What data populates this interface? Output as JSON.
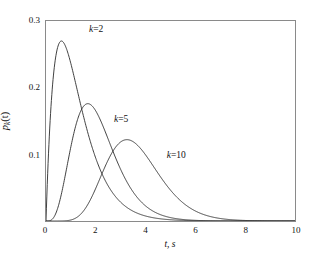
{
  "chart_data": {
    "type": "line",
    "title": "",
    "xlabel": "t, s",
    "ylabel": "p_k(t)",
    "ylabel_base": "p",
    "ylabel_sub": "k",
    "ylabel_arg": "(t)",
    "xlim": [
      0,
      10
    ],
    "ylim": [
      0,
      0.3
    ],
    "grid": false,
    "legend_position": "inline-annotations",
    "xticks": [
      {
        "value": 0,
        "label": "0"
      },
      {
        "value": 2,
        "label": "2"
      },
      {
        "value": 4,
        "label": "4"
      },
      {
        "value": 6,
        "label": "6"
      },
      {
        "value": 8,
        "label": "8"
      },
      {
        "value": 10,
        "label": "10"
      }
    ],
    "yticks": [
      {
        "value": 0.1,
        "label": "0.1"
      },
      {
        "value": 0.2,
        "label": "0.2"
      },
      {
        "value": 0.3,
        "label": "0.3"
      }
    ],
    "series": [
      {
        "name": "k=2",
        "label": "k=2",
        "k": 2,
        "color": "#2b2b2b",
        "peak_x": 0.62,
        "peak_y": 0.27,
        "annotation_x": 1.75,
        "annotation_y": 0.285,
        "x": [
          0.0,
          0.1,
          0.2,
          0.3,
          0.4,
          0.5,
          0.6,
          0.7,
          0.8,
          0.9,
          1.0,
          1.2,
          1.4,
          1.6,
          1.8,
          2.0,
          2.4,
          2.8,
          3.2,
          3.6,
          4.0,
          4.5,
          5.0,
          6.0,
          7.0,
          8.0,
          9.0,
          10.0
        ],
        "y": [
          0.0,
          0.1218,
          0.1968,
          0.2384,
          0.2569,
          0.2599,
          0.2529,
          0.2397,
          0.223,
          0.2045,
          0.1854,
          0.1483,
          0.1161,
          0.0895,
          0.0683,
          0.0515,
          0.0286,
          0.0155,
          0.0082,
          0.0043,
          0.0022,
          0.0009,
          0.0004,
          0.0001,
          0.0,
          0.0,
          0.0,
          0.0
        ]
      },
      {
        "name": "k=5",
        "label": "k=5",
        "k": 5,
        "color": "#2b2b2b",
        "peak_x": 1.68,
        "peak_y": 0.176,
        "annotation_x": 2.75,
        "annotation_y": 0.152,
        "x": [
          0.0,
          0.2,
          0.4,
          0.6,
          0.8,
          1.0,
          1.2,
          1.4,
          1.6,
          1.8,
          2.0,
          2.2,
          2.4,
          2.6,
          2.8,
          3.0,
          3.4,
          3.8,
          4.2,
          4.6,
          5.0,
          5.5,
          6.0,
          7.0,
          8.0,
          9.0,
          10.0
        ],
        "y": [
          0.0,
          0.0009,
          0.0123,
          0.0399,
          0.076,
          0.1109,
          0.1384,
          0.1563,
          0.1652,
          0.1669,
          0.1633,
          0.1563,
          0.1471,
          0.1367,
          0.1258,
          0.1149,
          0.0941,
          0.076,
          0.0607,
          0.0479,
          0.0375,
          0.0272,
          0.0195,
          0.0098,
          0.0048,
          0.0023,
          0.0011
        ]
      },
      {
        "name": "k=10",
        "label": "k=10",
        "k": 10,
        "color": "#2b2b2b",
        "peak_x": 3.25,
        "peak_y": 0.122,
        "annotation_x": 4.85,
        "annotation_y": 0.098,
        "x": [
          0.0,
          0.5,
          1.0,
          1.5,
          2.0,
          2.5,
          3.0,
          3.25,
          3.5,
          4.0,
          4.5,
          5.0,
          5.5,
          6.0,
          6.5,
          7.0,
          7.5,
          8.0,
          8.5,
          9.0,
          9.5,
          10.0
        ],
        "y": [
          0.0,
          0.0001,
          0.0021,
          0.0138,
          0.04,
          0.0745,
          0.1067,
          0.118,
          0.126,
          0.1337,
          0.1284,
          0.1144,
          0.0963,
          0.0777,
          0.0605,
          0.0458,
          0.0339,
          0.0246,
          0.0175,
          0.0123,
          0.0085,
          0.0058
        ]
      }
    ]
  },
  "figure": {
    "background": "#ffffff",
    "frame_color": "#8a8a8a",
    "curve_color": "#2b2b2b"
  }
}
